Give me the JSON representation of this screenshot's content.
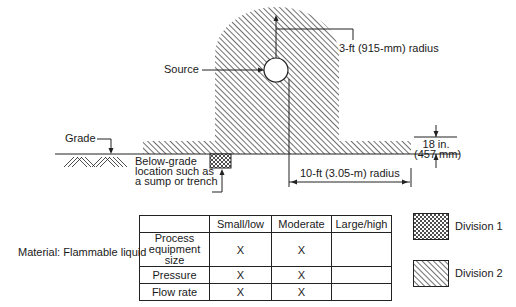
{
  "diagram": {
    "labels": {
      "source": "Source",
      "radius_3ft": "3-ft (915-mm) radius",
      "grade": "Grade",
      "below_grade_1": "Below-grade",
      "below_grade_2": "location such as",
      "below_grade_3": "a sump or trench",
      "height_18_1": "18 in.",
      "height_18_2": "(457 mm)",
      "radius_10ft": "10-ft (3.05-m) radius"
    }
  },
  "material_label": "Material: Flammable liquid",
  "table": {
    "headers": [
      "",
      "Small/low",
      "Moderate",
      "Large/high"
    ],
    "rows": [
      {
        "label_lines": [
          "Process",
          "equipment",
          "size"
        ],
        "small_low": "X",
        "moderate": "X",
        "large_high": ""
      },
      {
        "label": "Pressure",
        "small_low": "X",
        "moderate": "X",
        "large_high": ""
      },
      {
        "label": "Flow rate",
        "small_low": "X",
        "moderate": "X",
        "large_high": ""
      }
    ]
  },
  "legend": [
    {
      "pattern": "crosshatch",
      "label": "Division 1"
    },
    {
      "pattern": "diagonal-hatch",
      "label": "Division 2"
    }
  ]
}
